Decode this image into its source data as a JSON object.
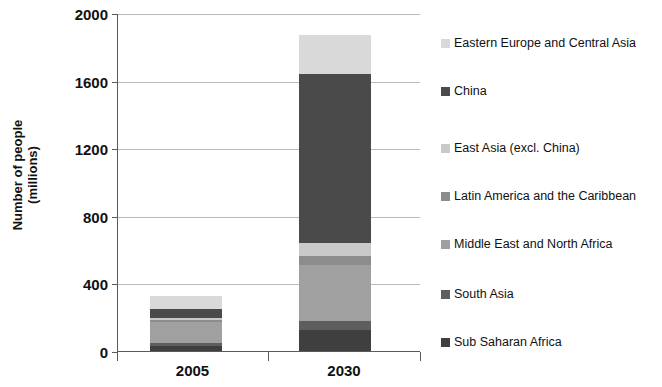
{
  "chart_data": {
    "type": "bar",
    "subtype": "stacked-bar",
    "title": "",
    "xlabel": "",
    "ylabel": "Number of people (millions)",
    "ylabel_lines": [
      "Number of people",
      "(millions)"
    ],
    "categories": [
      "2005",
      "2030"
    ],
    "ylim": [
      0,
      2000
    ],
    "yticks": [
      0,
      400,
      800,
      1200,
      1600,
      2000
    ],
    "ytick_labels": [
      "0",
      "400",
      "800",
      "1200",
      "1600",
      "2000"
    ],
    "grid": true,
    "grid_axis": "y",
    "legend_position": "right",
    "series": [
      {
        "name": "Sub Saharan Africa",
        "color": "#3f3f3f",
        "values": [
          30,
          125
        ]
      },
      {
        "name": "South Asia",
        "color": "#5e5e5e",
        "values": [
          18,
          55
        ]
      },
      {
        "name": "Middle East and North Africa",
        "color": "#a0a0a0",
        "values": [
          125,
          330
        ]
      },
      {
        "name": "Latin America and the Caribbean",
        "color": "#8c8c8c",
        "values": [
          10,
          55
        ]
      },
      {
        "name": "East Asia (excl. China)",
        "color": "#c9c9c9",
        "values": [
          12,
          75
        ]
      },
      {
        "name": "China",
        "color": "#4a4a4a",
        "values": [
          55,
          1000
        ]
      },
      {
        "name": "Eastern Europe and Central Asia",
        "color": "#d9d9d9",
        "values": [
          75,
          230
        ]
      }
    ],
    "totals": [
      325,
      1870
    ],
    "legend_entries": [
      "Eastern Europe and Central Asia",
      "China",
      "East Asia (excl. China)",
      "Latin America and the Caribbean",
      "Middle East and North Africa",
      "South Asia",
      "Sub Saharan Africa"
    ]
  },
  "legend": {
    "items": [
      {
        "label": "Eastern Europe and Central Asia",
        "color": "#d9d9d9",
        "top": 0
      },
      {
        "label": "China",
        "color": "#4a4a4a",
        "top": 48
      },
      {
        "label": "East Asia (excl. China)",
        "color": "#c9c9c9",
        "top": 105
      },
      {
        "label": "Latin America and the Caribbean",
        "color": "#8c8c8c",
        "top": 153
      },
      {
        "label": "Middle East and North Africa",
        "color": "#a0a0a0",
        "top": 201
      },
      {
        "label": "South Asia",
        "color": "#5e5e5e",
        "top": 251
      },
      {
        "label": "Sub Saharan Africa",
        "color": "#3f3f3f",
        "top": 299
      }
    ]
  },
  "axis": {
    "y_title_line1": "Number of people",
    "y_title_line2": "(millions)",
    "y_ticks": [
      "2000",
      "1600",
      "1200",
      "800",
      "400",
      "0"
    ],
    "x_categories": [
      "2005",
      "2030"
    ]
  }
}
